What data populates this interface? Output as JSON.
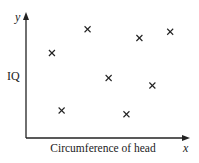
{
  "chart_data": {
    "type": "scatter",
    "title": "",
    "xlabel": "Circumference of head",
    "ylabel": "IQ",
    "x_axis_symbol": "x",
    "y_axis_symbol": "y",
    "marker": "cross",
    "xlim": [
      0,
      10
    ],
    "ylim": [
      0,
      10
    ],
    "grid": false,
    "legend": null,
    "tick_labels": false,
    "note": "No numeric ticks shown; values are relative positions on a 0-10 scale",
    "points": [
      {
        "x": 1.6,
        "y": 6.8
      },
      {
        "x": 3.8,
        "y": 8.7
      },
      {
        "x": 7.0,
        "y": 8.0
      },
      {
        "x": 8.9,
        "y": 8.5
      },
      {
        "x": 5.1,
        "y": 4.8
      },
      {
        "x": 7.8,
        "y": 4.2
      },
      {
        "x": 2.2,
        "y": 2.2
      },
      {
        "x": 6.2,
        "y": 1.9
      }
    ]
  },
  "colors": {
    "ink": "#222222",
    "background": "#ffffff"
  }
}
